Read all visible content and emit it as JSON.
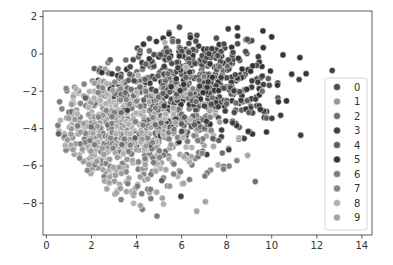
{
  "chart_data": {
    "type": "scatter",
    "title": "",
    "xlabel": "",
    "ylabel": "",
    "xlim": [
      -0.15,
      14.45
    ],
    "ylim": [
      -9.7,
      2.3
    ],
    "xticks": [
      0,
      2,
      4,
      6,
      8,
      10,
      12,
      14
    ],
    "yticks": [
      2,
      0,
      -2,
      -4,
      -6,
      -8
    ],
    "grid": false,
    "legend_position": "right-center inside",
    "legend": {
      "title": "",
      "entries": [
        "0",
        "1",
        "2",
        "3",
        "4",
        "5",
        "6",
        "7",
        "8",
        "9"
      ]
    },
    "series": [
      {
        "name": "0",
        "color": "#4d4d4d",
        "center": [
          6.5,
          -1.0
        ],
        "spread": [
          1.6,
          1.2
        ],
        "n": 140
      },
      {
        "name": "1",
        "color": "#9a9a9a",
        "center": [
          2.2,
          -4.5
        ],
        "spread": [
          1.2,
          1.3
        ],
        "n": 140
      },
      {
        "name": "2",
        "color": "#6e6e6e",
        "center": [
          5.0,
          -3.0
        ],
        "spread": [
          1.9,
          1.5
        ],
        "n": 140
      },
      {
        "name": "3",
        "color": "#3f3f3f",
        "center": [
          7.0,
          -2.0
        ],
        "spread": [
          1.8,
          1.4
        ],
        "n": 140
      },
      {
        "name": "4",
        "color": "#5f5f5f",
        "center": [
          5.5,
          -2.5
        ],
        "spread": [
          2.0,
          1.5
        ],
        "n": 140
      },
      {
        "name": "5",
        "color": "#353535",
        "center": [
          6.8,
          -1.6
        ],
        "spread": [
          2.0,
          1.4
        ],
        "n": 140
      },
      {
        "name": "6",
        "color": "#7d7d7d",
        "center": [
          4.0,
          -4.5
        ],
        "spread": [
          1.8,
          1.6
        ],
        "n": 140
      },
      {
        "name": "7",
        "color": "#858585",
        "center": [
          3.5,
          -4.0
        ],
        "spread": [
          1.9,
          1.6
        ],
        "n": 140
      },
      {
        "name": "8",
        "color": "#b0b0b0",
        "center": [
          3.2,
          -3.8
        ],
        "spread": [
          1.8,
          1.7
        ],
        "n": 140
      },
      {
        "name": "9",
        "color": "#a3a3a3",
        "center": [
          3.5,
          -5.0
        ],
        "spread": [
          1.9,
          1.6
        ],
        "n": 140
      }
    ]
  }
}
